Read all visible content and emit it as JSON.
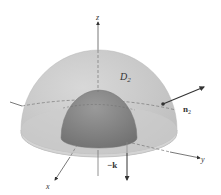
{
  "figure": {
    "axes": {
      "z_label": "z",
      "y_label": "y",
      "x_label": "x"
    },
    "labels": {
      "region": "D",
      "region_sub": "2",
      "normal": "n",
      "normal_sub": "2",
      "down_vector": "−k"
    },
    "colors": {
      "outer_hemisphere": "#cfcfcf",
      "outer_base": "#d6d6d6",
      "inner_hemisphere": "#8e8e8e",
      "axis": "#555555",
      "vector": "#333333"
    }
  }
}
